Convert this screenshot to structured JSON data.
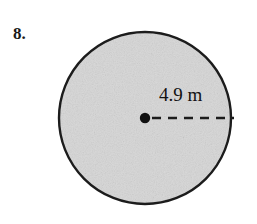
{
  "figure": {
    "problem_number": "8.",
    "shape": "circle",
    "shape_icon": "circle-icon",
    "center_point_icon": "center-dot-icon",
    "radius_line_icon": "dashed-radius-line-icon",
    "dimension_label": "4.9 m",
    "dimension_value": 4.9,
    "dimension_unit": "m",
    "dimension_type": "radius",
    "colors": {
      "background": "#ffffff",
      "fill": "#d6d6d6",
      "stroke": "#1c1c1c",
      "text": "#121212",
      "dash": "#1c1c1c",
      "center_dot": "#101010"
    },
    "geometry": {
      "center_x": 145,
      "center_y": 118,
      "radius_px": 87,
      "stroke_width_px": 2,
      "dash_start_x": 152,
      "dash_end_x": 234,
      "dash_y": 118
    }
  }
}
